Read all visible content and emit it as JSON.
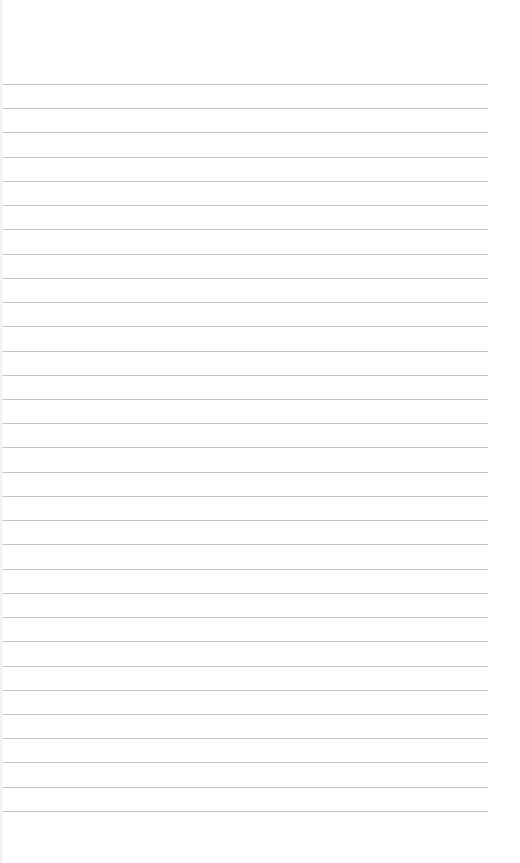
{
  "paper": {
    "type": "lined-paper",
    "background": "#ffffff",
    "line_color": "#c4c4c4",
    "line_count": 31,
    "first_line_y": 84,
    "line_spacing": 24.23,
    "line_left": 3,
    "line_right": 488,
    "text": ""
  }
}
